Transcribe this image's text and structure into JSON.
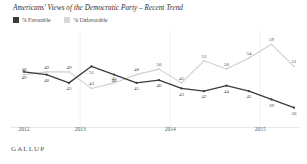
{
  "chart_data": {
    "type": "line",
    "title": "Americans' Views of the Democratic Party – Recent Trend",
    "xlabel": "",
    "ylabel": "",
    "ylim": [
      33,
      62
    ],
    "grid": false,
    "legend_position": "top-left",
    "categories": [
      "2012",
      "2013",
      "2013",
      "2013",
      "2013",
      "2014",
      "2014",
      "2014",
      "2014",
      "2015",
      "2015",
      "2015",
      "2015"
    ],
    "x_tick_labels": [
      "2012",
      "2013",
      "2014",
      "2015"
    ],
    "series": [
      {
        "name": "% Favorable",
        "color": "#3b3b3b",
        "values": [
          49,
          48,
          45,
          51,
          48,
          45,
          46,
          43,
          42,
          44,
          42,
          39,
          36
        ],
        "point_labels": [
          "49",
          "48",
          "45",
          "51",
          "48",
          "45",
          "46",
          "43",
          "42",
          "44",
          "42",
          "39",
          "36"
        ]
      },
      {
        "name": "% Unfavorable",
        "color": "#d0d0d0",
        "values": [
          48,
          49,
          49,
          43,
          45,
          48,
          50,
          45,
          53,
          50,
          54,
          59,
          51
        ],
        "point_labels": [
          "48",
          "49",
          "49",
          "43",
          "45",
          "48",
          "50",
          "45",
          "53",
          "50",
          "54",
          "59",
          "51"
        ]
      }
    ]
  },
  "legend": {
    "favorable_label": "% Favorable",
    "unfavorable_label": "% Unfavorable",
    "favorable_color": "#3b3b3b",
    "unfavorable_color": "#d8d8d8"
  },
  "footer": {
    "source": "GALLUP"
  }
}
